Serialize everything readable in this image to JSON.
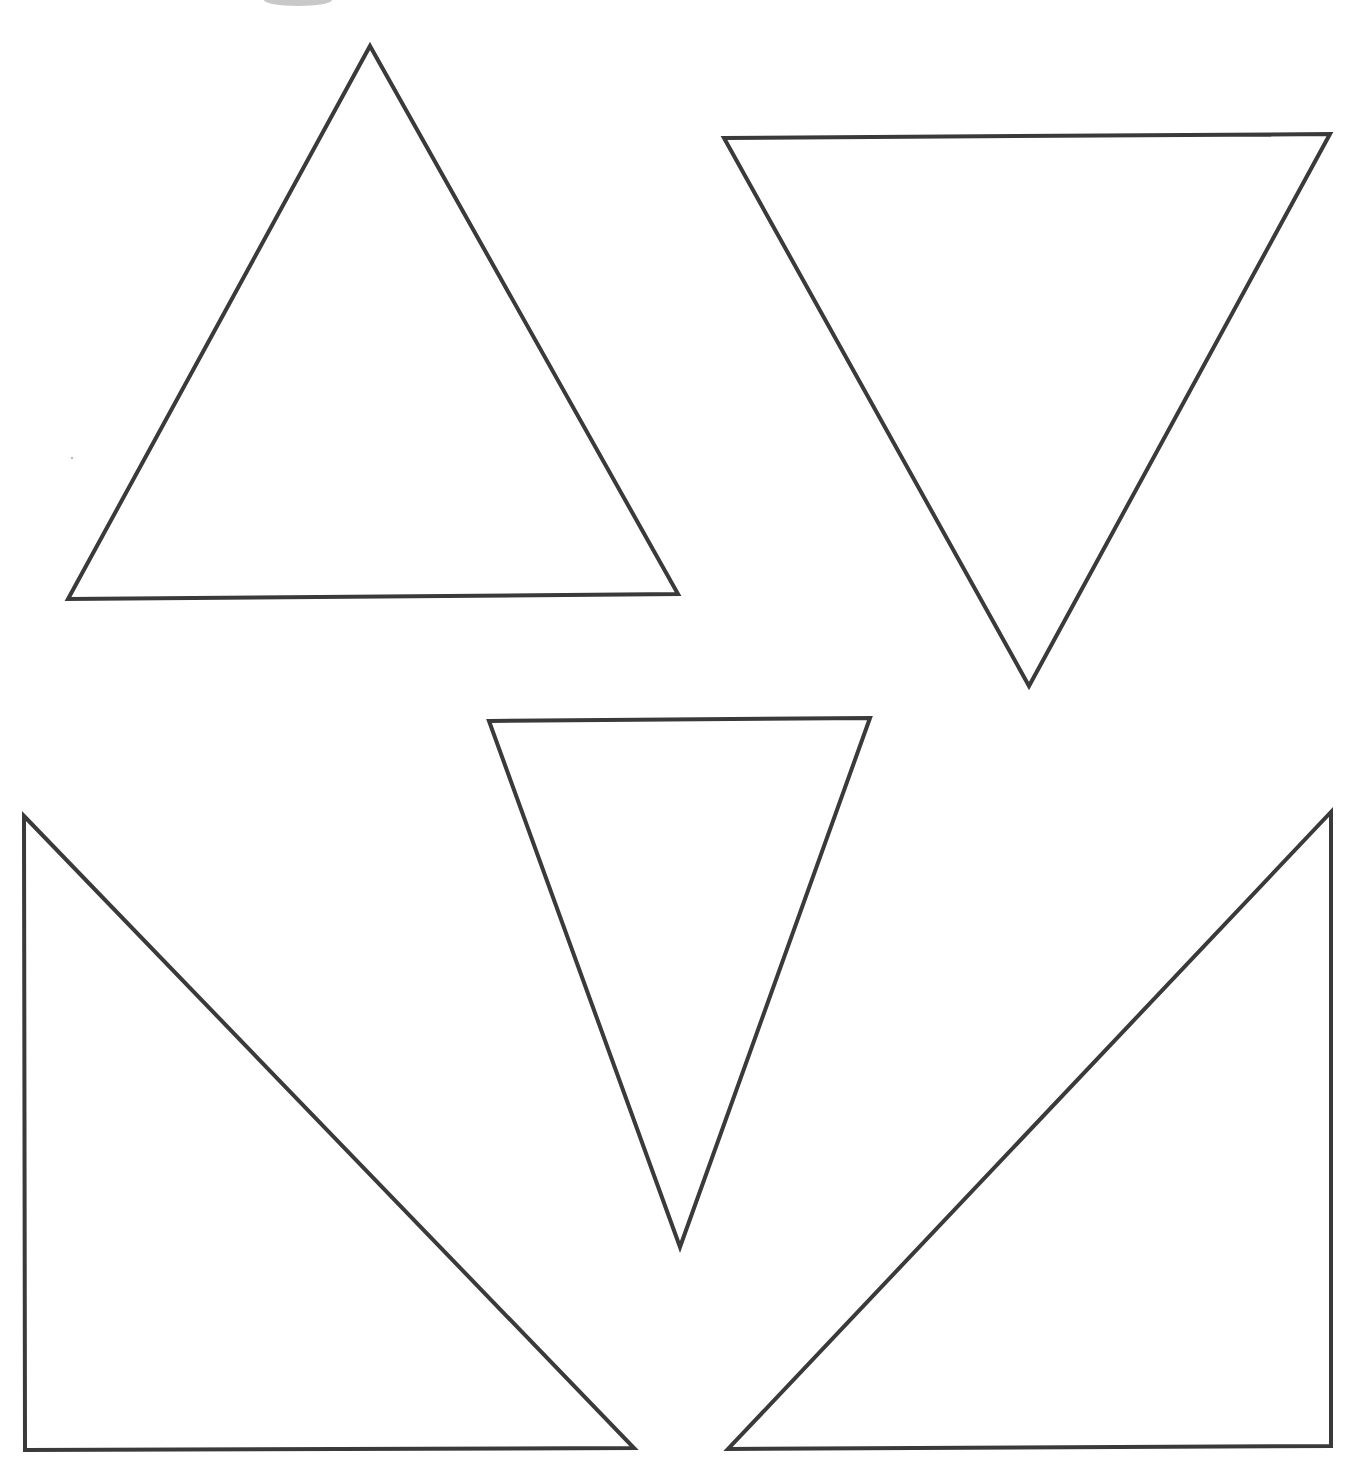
{
  "page": {
    "width": 1355,
    "height": 1464,
    "background": "#ffffff"
  },
  "style": {
    "stroke_color": "#3a3a3a",
    "stroke_width": 4,
    "fill": "#ffffff"
  },
  "decorations": {
    "top_blob": {
      "cx": 298,
      "cy": 0,
      "rx": 34,
      "ry": 6,
      "color": "#c8c8c8"
    },
    "stray_dot": {
      "cx": 72,
      "cy": 458,
      "r": 1.2,
      "color": "#bdbdbd"
    }
  },
  "shapes": [
    {
      "id": "triangle-1",
      "kind": "equilateral-triangle-upright",
      "points": [
        [
          370,
          46
        ],
        [
          678,
          594
        ],
        [
          68,
          599
        ]
      ]
    },
    {
      "id": "triangle-2",
      "kind": "inverted-triangle-large",
      "points": [
        [
          724,
          138
        ],
        [
          1330,
          134
        ],
        [
          1029,
          686
        ]
      ]
    },
    {
      "id": "triangle-3",
      "kind": "inverted-triangle-narrow",
      "points": [
        [
          489,
          721
        ],
        [
          870,
          718
        ],
        [
          680,
          1247
        ]
      ]
    },
    {
      "id": "triangle-4",
      "kind": "right-triangle-left",
      "points": [
        [
          24,
          816
        ],
        [
          634,
          1448
        ],
        [
          25,
          1450
        ]
      ]
    },
    {
      "id": "triangle-5",
      "kind": "right-triangle-right",
      "points": [
        [
          1331,
          812
        ],
        [
          1331,
          1446
        ],
        [
          728,
          1449
        ]
      ]
    }
  ]
}
